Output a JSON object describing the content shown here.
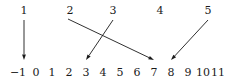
{
  "figure": {
    "kind": "number-line-mapping-diagram",
    "width": 226,
    "height": 83,
    "stroke_color": "#1a1a1a",
    "background_color": "#ffffff"
  },
  "top_labels": [
    {
      "text": "1",
      "x": 24
    },
    {
      "text": "2",
      "x": 70
    },
    {
      "text": "3",
      "x": 113
    },
    {
      "text": "4",
      "x": 160
    },
    {
      "text": "5",
      "x": 208
    }
  ],
  "axis": {
    "label_y": 66,
    "ticks": [
      {
        "text": "−1",
        "x": 18
      },
      {
        "text": "0",
        "x": 36
      },
      {
        "text": "1",
        "x": 52
      },
      {
        "text": "2",
        "x": 69
      },
      {
        "text": "3",
        "x": 86
      },
      {
        "text": "4",
        "x": 103
      },
      {
        "text": "5",
        "x": 120
      },
      {
        "text": "6",
        "x": 137
      },
      {
        "text": "7",
        "x": 154
      },
      {
        "text": "8",
        "x": 171
      },
      {
        "text": "9",
        "x": 188
      },
      {
        "text": "10",
        "x": 203
      },
      {
        "text": "11",
        "x": 218
      }
    ]
  },
  "arrows": [
    {
      "name": "arrow-1-to-neg1",
      "from_label": "1",
      "to_tick": "−1",
      "x1": 24,
      "y1": 20,
      "x2": 24,
      "y2": 60
    },
    {
      "name": "arrow-2-to-7",
      "from_label": "2",
      "to_tick": "7",
      "x1": 68,
      "y1": 19,
      "x2": 154,
      "y2": 60
    },
    {
      "name": "arrow-3-to-3",
      "from_label": "3",
      "to_tick": "3",
      "x1": 113,
      "y1": 20,
      "x2": 86,
      "y2": 60
    },
    {
      "name": "arrow-5-to-8",
      "from_label": "5",
      "to_tick": "8",
      "x1": 208,
      "y1": 20,
      "x2": 171,
      "y2": 60
    }
  ]
}
